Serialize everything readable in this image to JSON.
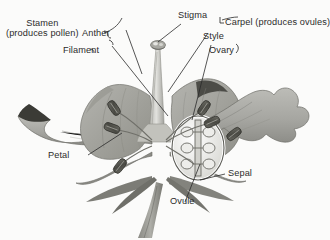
{
  "diagram": {
    "background_color": "#fbfbfa",
    "ink_color": "#2b2b2b",
    "petal_color": "#a9a9a4",
    "petal_shade": "#8d8d88",
    "petal_dark": "#5a5a56",
    "anther_color": "#55554f",
    "style_color": "#c9c9c4"
  },
  "labels": {
    "stamen": {
      "line1": "Stamen",
      "line2": "(produces pollen)"
    },
    "anther": "Anther",
    "filament": "Filament",
    "stigma": "Stigma",
    "carpel": "Carpel (produces ovules)",
    "style": "Style",
    "ovary": "Ovary",
    "petal": "Petal",
    "sepal": "Sepal",
    "ovule": "Ovule"
  },
  "parts": {
    "ovule_count": 6,
    "anther_count": 6,
    "petal_count": 4,
    "sepal_count": 4
  }
}
